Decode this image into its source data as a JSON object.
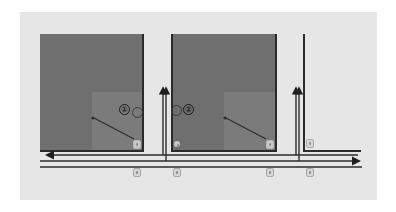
{
  "diagram": {
    "type": "traffic-layout",
    "background_color": "#e6e6e6",
    "block_color": "#6f6f6f",
    "inner_zone_color": "#7b7b7b",
    "line_color": "#2b2b2b",
    "blocks": [
      {
        "id": "block-1",
        "x": 40,
        "y": 34,
        "w": 104,
        "h": 118,
        "inner": {
          "x": 92,
          "y": 92,
          "w": 52,
          "h": 60
        }
      },
      {
        "id": "block-2",
        "x": 171,
        "y": 34,
        "w": 106,
        "h": 118,
        "inner": {
          "x": 224,
          "y": 92,
          "w": 53,
          "h": 60
        }
      }
    ],
    "markers": [
      {
        "id": "marker-1",
        "label": "①",
        "x": 120,
        "y": 105
      },
      {
        "id": "marker-0a",
        "label": "",
        "x": 132,
        "y": 107
      },
      {
        "id": "marker-0b",
        "label": "",
        "x": 171,
        "y": 106
      },
      {
        "id": "marker-2",
        "label": "②",
        "x": 183,
        "y": 105
      }
    ],
    "cameras": [
      {
        "id": "camera-1",
        "x": 133,
        "y": 140
      },
      {
        "id": "camera-2",
        "x": 173,
        "y": 140
      },
      {
        "id": "camera-3",
        "x": 266,
        "y": 140
      },
      {
        "id": "camera-4",
        "x": 306,
        "y": 138
      },
      {
        "id": "camera-5",
        "x": 133,
        "y": 168
      },
      {
        "id": "camera-6",
        "x": 173,
        "y": 168
      },
      {
        "id": "camera-7",
        "x": 266,
        "y": 168
      },
      {
        "id": "camera-8",
        "x": 306,
        "y": 168
      }
    ],
    "roads": {
      "horizontal": [
        {
          "id": "lane-westbound",
          "direction": "left",
          "y": 155,
          "x1": 46,
          "x2": 358
        },
        {
          "id": "lane-eastbound",
          "direction": "right",
          "y": 161,
          "x1": 40,
          "x2": 360
        },
        {
          "id": "road-edge",
          "direction": "none",
          "y": 167,
          "x1": 40,
          "x2": 362
        }
      ],
      "vertical": [
        {
          "id": "cross-street-1",
          "direction": "up",
          "x": 164,
          "y1": 87,
          "y2": 161
        },
        {
          "id": "cross-street-2",
          "direction": "up",
          "x": 297,
          "y1": 87,
          "y2": 161
        }
      ]
    },
    "trajectories": [
      {
        "id": "path-1",
        "from": [
          135,
          139
        ],
        "to": [
          93,
          118
        ]
      },
      {
        "id": "path-2",
        "from": [
          268,
          139
        ],
        "to": [
          225,
          118
        ]
      }
    ]
  }
}
